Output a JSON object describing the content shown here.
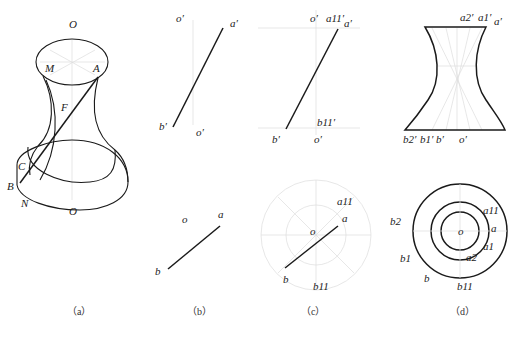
{
  "figure": {
    "panels": [
      {
        "id": "a",
        "caption": "（a）",
        "labels": {
          "O_top": "O",
          "M": "M",
          "A": "A",
          "F": "F",
          "C": "C",
          "B": "B",
          "N": "N",
          "O_bottom": "O"
        }
      },
      {
        "id": "b",
        "caption": "（b）",
        "labels": {
          "o_prime_top": "o′",
          "a_prime": "a′",
          "b_prime": "b′",
          "o_prime_bottom": "o′",
          "o": "o",
          "a": "a",
          "b": "b"
        }
      },
      {
        "id": "c",
        "caption": "（c）",
        "labels": {
          "o_prime_top": "o′",
          "a11_prime": "a11′",
          "a_prime": "a′",
          "b11_prime": "b11′",
          "b_prime": "b′",
          "o_prime_bottom": "o′",
          "a11": "a11",
          "a": "a",
          "o": "o",
          "b": "b",
          "b11": "b11"
        }
      },
      {
        "id": "d",
        "caption": "（d）",
        "labels": {
          "a2_prime": "a2′",
          "a1_prime": "a1′",
          "a_prime": "a′",
          "b2_prime": "b2′",
          "b1_prime": "b1′",
          "b_prime": "b′",
          "o_prime": "o′",
          "a11": "a11",
          "a": "a",
          "a1": "a1",
          "a2": "a2",
          "o": "o",
          "b2": "b2",
          "b1": "b1",
          "b": "b",
          "b11": "b11"
        }
      }
    ]
  }
}
